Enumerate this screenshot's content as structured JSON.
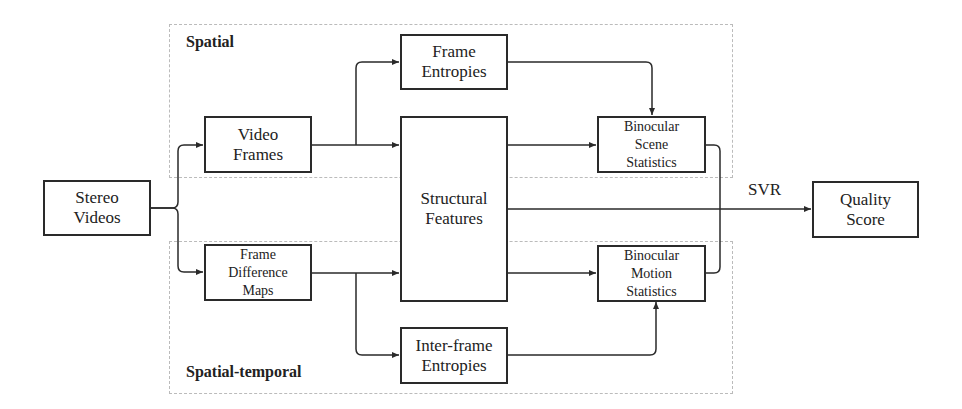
{
  "regions": {
    "spatial": "Spatial",
    "spatial_temporal": "Spatial-temporal"
  },
  "nodes": {
    "stereo_videos": "Stereo\nVideos",
    "video_frames": "Video\nFrames",
    "frame_difference_maps": "Frame\nDifference\nMaps",
    "frame_entropies": "Frame\nEntropies",
    "structural_features": "Structural\nFeatures",
    "inter_frame_entropies": "Inter-frame\nEntropies",
    "binocular_scene_statistics": "Binocular\nScene\nStatistics",
    "binocular_motion_statistics": "Binocular\nMotion\nStatistics",
    "quality_score": "Quality\nScore"
  },
  "edge_labels": {
    "svr": "SVR"
  },
  "edges": [
    [
      "stereo_videos",
      "video_frames"
    ],
    [
      "stereo_videos",
      "frame_difference_maps"
    ],
    [
      "video_frames",
      "frame_entropies"
    ],
    [
      "video_frames",
      "structural_features"
    ],
    [
      "frame_difference_maps",
      "structural_features"
    ],
    [
      "frame_difference_maps",
      "inter_frame_entropies"
    ],
    [
      "frame_entropies",
      "binocular_scene_statistics"
    ],
    [
      "structural_features",
      "binocular_scene_statistics"
    ],
    [
      "structural_features",
      "binocular_motion_statistics"
    ],
    [
      "structural_features",
      "quality_score"
    ],
    [
      "inter_frame_entropies",
      "binocular_motion_statistics"
    ],
    [
      "binocular_scene_statistics",
      "quality_score"
    ],
    [
      "binocular_motion_statistics",
      "quality_score"
    ]
  ]
}
